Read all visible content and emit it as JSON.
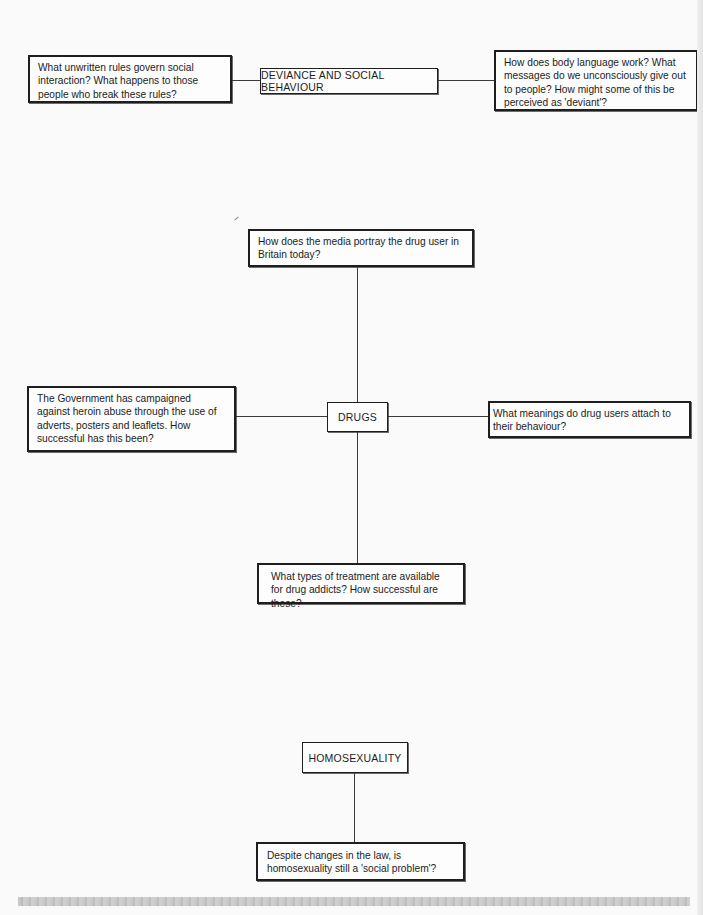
{
  "diagram": {
    "sections": [
      {
        "topic": "DEVIANCE AND SOCIAL BEHAVIOUR",
        "questions": [
          "What unwritten rules govern social interaction? What happens to those people who break these rules?",
          "How does body language work? What messages do we unconsciously give out to people? How might some of this be perceived as 'deviant'?"
        ]
      },
      {
        "topic": "DRUGS",
        "questions": [
          "How does the media portray the drug user in Britain today?",
          "The Government has campaigned against heroin abuse through the use of adverts, posters and leaflets. How successful has this been?",
          "What meanings do drug users attach to their behaviour?",
          "What types of treatment are available for drug addicts? How successful are these?"
        ]
      },
      {
        "topic": "HOMOSEXUALITY",
        "questions": [
          "Despite changes in the law, is homosexuality still a 'social problem'?"
        ]
      }
    ]
  },
  "colors": {
    "page_background": "#fafafa",
    "box_border": "#1e1e1e",
    "connector": "#3a3a3a",
    "footer_bar": "#c6c6c6"
  }
}
